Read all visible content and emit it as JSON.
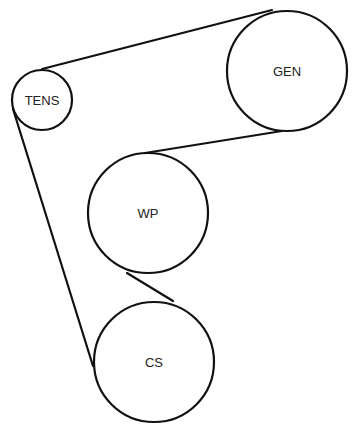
{
  "diagram": {
    "type": "belt-routing",
    "background": "#ffffff",
    "line_color": "#111111",
    "text_color": "#222222",
    "pulleys": [
      {
        "id": "tens",
        "label": "TENS",
        "cx": 42,
        "cy": 100,
        "r": 30
      },
      {
        "id": "gen",
        "label": "GEN",
        "cx": 287,
        "cy": 71,
        "r": 60
      },
      {
        "id": "wp",
        "label": "WP",
        "cx": 148,
        "cy": 213,
        "r": 60
      },
      {
        "id": "cs",
        "label": "CS",
        "cx": 154,
        "cy": 362,
        "r": 60
      }
    ],
    "belt_segments": [
      {
        "from": "TENS",
        "to": "GEN",
        "x1": 42,
        "y1": 69,
        "x2": 272,
        "y2": 10
      },
      {
        "from": "GEN",
        "to": "WP",
        "x1": 282,
        "y1": 131,
        "x2": 145,
        "y2": 153
      },
      {
        "from": "WP",
        "to": "CS",
        "x1": 127,
        "y1": 273,
        "x2": 173,
        "y2": 301
      },
      {
        "from": "CS",
        "to": "TENS",
        "x1": 93,
        "y1": 366,
        "x2": 13,
        "y2": 109
      }
    ]
  }
}
